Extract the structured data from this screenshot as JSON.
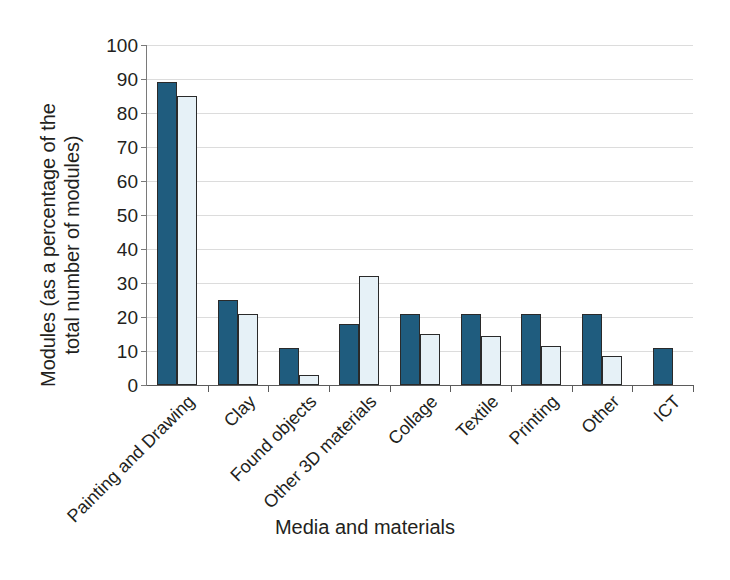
{
  "chart_data": {
    "type": "bar",
    "title": "",
    "xlabel": "Media and materials",
    "ylabel": "Modules (as a percentage of the\ntotal number of modules)",
    "ylim": [
      0,
      100
    ],
    "ytick_step": 10,
    "yticks": [
      0,
      10,
      20,
      30,
      40,
      50,
      60,
      70,
      80,
      90,
      100
    ],
    "grid": true,
    "legend": "none",
    "categories": [
      "Painting and Drawing",
      "Clay",
      "Found objects",
      "Other 3D materials",
      "Collage",
      "Textile",
      "Printing",
      "Other",
      "ICT"
    ],
    "series": [
      {
        "name": "Series 1",
        "color": "#1f5c7e",
        "values": [
          89,
          25,
          11,
          18,
          21,
          21,
          21,
          21,
          11
        ]
      },
      {
        "name": "Series 2",
        "color": "#e6f1f7",
        "values": [
          85,
          21,
          3,
          32,
          15,
          14.5,
          11.5,
          8.5,
          null
        ]
      }
    ]
  },
  "axes": {
    "grid_color": "#dcdcdc",
    "axis_color": "#5b5b5b",
    "bar_outline_color": "#2a2a2a"
  }
}
